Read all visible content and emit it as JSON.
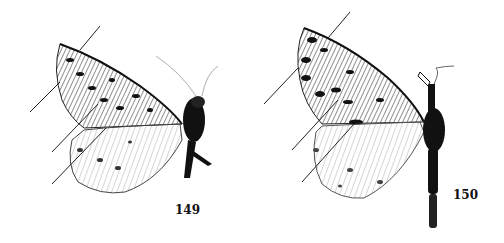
{
  "plate": {
    "background": "#ffffff",
    "figures": [
      {
        "number": "149",
        "subject": "moth specimen, left-side view, wings spread, with leader lines",
        "ink": "#111111"
      },
      {
        "number": "150",
        "subject": "moth specimen, left-side view, elongated body, with leader lines",
        "ink": "#111111"
      }
    ]
  }
}
